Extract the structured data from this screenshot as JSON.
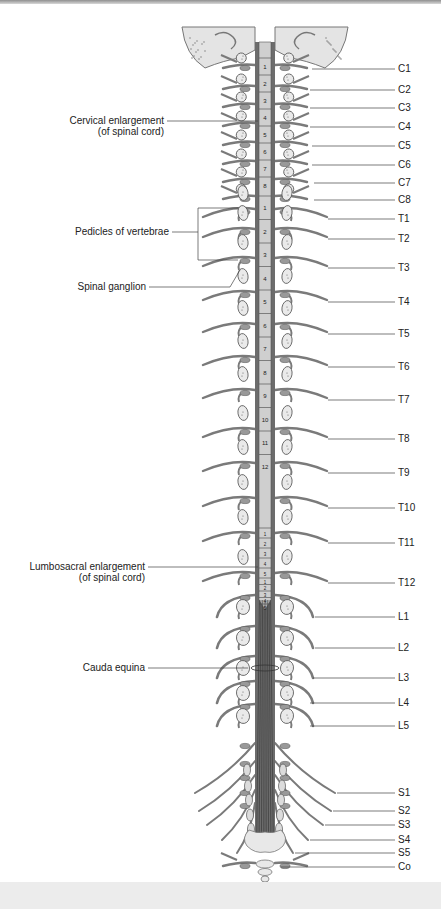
{
  "figure": {
    "colors": {
      "nerve": "#7a7a7a",
      "nerve_dark": "#5a5a5a",
      "bone": "#e4e4e4",
      "bone_stroke": "#777777",
      "cord": "#cfcfcf",
      "cauda": "#4a4a4a",
      "leader": "#444444"
    },
    "left_labels": [
      {
        "id": "cervical-enlargement",
        "lines": [
          "Cervical enlargement",
          "(of spinal cord)"
        ],
        "y": 121,
        "right": 164,
        "target_x": 258,
        "target_y": 121
      },
      {
        "id": "pedicles-of-vertebrae",
        "lines": [
          "Pedicles of vertebrae"
        ],
        "y": 232,
        "right": 169,
        "target_x": 198,
        "target_y": 232
      },
      {
        "id": "spinal-ganglion",
        "lines": [
          "Spinal ganglion"
        ],
        "y": 287,
        "right": 146,
        "target_x": 240,
        "target_y": 270
      },
      {
        "id": "lumbosacral-enlargement",
        "lines": [
          "Lumbosacral enlargement",
          "(of spinal cord)"
        ],
        "y": 567,
        "right": 145,
        "target_x": 258,
        "target_y": 567
      },
      {
        "id": "cauda-equina",
        "lines": [
          "Cauda equina"
        ],
        "y": 668,
        "right": 145,
        "target_x": 248,
        "target_y": 668
      }
    ],
    "right_labels": [
      {
        "name": "C1",
        "y": 69,
        "line_x": 312
      },
      {
        "name": "C2",
        "y": 90,
        "line_x": 310
      },
      {
        "name": "C3",
        "y": 108,
        "line_x": 310
      },
      {
        "name": "C4",
        "y": 127,
        "line_x": 310
      },
      {
        "name": "C5",
        "y": 146,
        "line_x": 312
      },
      {
        "name": "C6",
        "y": 165,
        "line_x": 312
      },
      {
        "name": "C7",
        "y": 183,
        "line_x": 314
      },
      {
        "name": "C8",
        "y": 200,
        "line_x": 314
      },
      {
        "name": "T1",
        "y": 219,
        "line_x": 328
      },
      {
        "name": "T2",
        "y": 239,
        "line_x": 328
      },
      {
        "name": "T3",
        "y": 268,
        "line_x": 328
      },
      {
        "name": "T4",
        "y": 302,
        "line_x": 328
      },
      {
        "name": "T5",
        "y": 334,
        "line_x": 328
      },
      {
        "name": "T6",
        "y": 367,
        "line_x": 328
      },
      {
        "name": "T7",
        "y": 400,
        "line_x": 328
      },
      {
        "name": "T8",
        "y": 439,
        "line_x": 328
      },
      {
        "name": "T9",
        "y": 473,
        "line_x": 328
      },
      {
        "name": "T10",
        "y": 508,
        "line_x": 328
      },
      {
        "name": "T11",
        "y": 543,
        "line_x": 328
      },
      {
        "name": "T12",
        "y": 583,
        "line_x": 328
      },
      {
        "name": "L1",
        "y": 617,
        "line_x": 315
      },
      {
        "name": "L2",
        "y": 648,
        "line_x": 315
      },
      {
        "name": "L3",
        "y": 678,
        "line_x": 313
      },
      {
        "name": "L4",
        "y": 703,
        "line_x": 310
      },
      {
        "name": "L5",
        "y": 726,
        "line_x": 310
      },
      {
        "name": "S1",
        "y": 793,
        "line_x": 337
      },
      {
        "name": "S2",
        "y": 811,
        "line_x": 333
      },
      {
        "name": "S3",
        "y": 825,
        "line_x": 325
      },
      {
        "name": "S4",
        "y": 840,
        "line_x": 310
      },
      {
        "name": "S5",
        "y": 853,
        "line_x": 295
      },
      {
        "name": "Co",
        "y": 867,
        "line_x": 281
      }
    ],
    "cord_segments": {
      "cervical": [
        "1",
        "2",
        "3",
        "4",
        "5",
        "6",
        "7",
        "8"
      ],
      "thoracic": [
        "1",
        "2",
        "3",
        "4",
        "5",
        "6",
        "7",
        "8",
        "9",
        "10",
        "11",
        "12"
      ],
      "lumbar": [
        "1",
        "2",
        "3",
        "4",
        "5"
      ],
      "sacral": [
        "1",
        "2",
        "3",
        "4",
        "5"
      ]
    }
  }
}
